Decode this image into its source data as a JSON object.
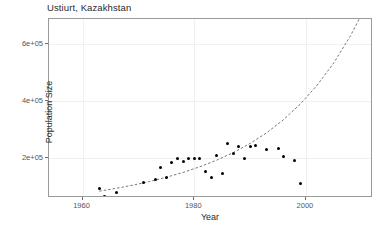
{
  "chart_data": {
    "type": "scatter",
    "title": "Ustiurt, Kazakhstan",
    "xlabel": "Year",
    "ylabel": "Population Size",
    "grid": true,
    "legend": false,
    "xlim": [
      1954,
      2012
    ],
    "ylim": [
      58000,
      688000
    ],
    "xticks": [
      1960,
      1980,
      2000
    ],
    "xtick_labels": [
      "1960",
      "1980",
      "2000"
    ],
    "yticks": [
      200000,
      400000,
      600000
    ],
    "ytick_labels": [
      "2e+05",
      "4e+05",
      "6e+05"
    ],
    "series": [
      {
        "name": "Observed population",
        "marker": "filled-circle",
        "color": "#000000",
        "points": [
          {
            "x": 1963,
            "y": 90000
          },
          {
            "x": 1964,
            "y": 63000
          },
          {
            "x": 1966,
            "y": 79000
          },
          {
            "x": 1971,
            "y": 112000
          },
          {
            "x": 1973,
            "y": 124000
          },
          {
            "x": 1974,
            "y": 164000
          },
          {
            "x": 1975,
            "y": 131000
          },
          {
            "x": 1976,
            "y": 182000
          },
          {
            "x": 1977,
            "y": 196000
          },
          {
            "x": 1978,
            "y": 185000
          },
          {
            "x": 1979,
            "y": 197000
          },
          {
            "x": 1980,
            "y": 197000
          },
          {
            "x": 1981,
            "y": 197000
          },
          {
            "x": 1982,
            "y": 150000
          },
          {
            "x": 1983,
            "y": 131000
          },
          {
            "x": 1984,
            "y": 209000
          },
          {
            "x": 1985,
            "y": 143000
          },
          {
            "x": 1986,
            "y": 251000
          },
          {
            "x": 1987,
            "y": 216000
          },
          {
            "x": 1988,
            "y": 240000
          },
          {
            "x": 1989,
            "y": 197000
          },
          {
            "x": 1990,
            "y": 240000
          },
          {
            "x": 1991,
            "y": 243000
          },
          {
            "x": 1993,
            "y": 228000
          },
          {
            "x": 1995,
            "y": 232000
          },
          {
            "x": 1996,
            "y": 205000
          },
          {
            "x": 1998,
            "y": 190000
          },
          {
            "x": 1999,
            "y": 108000
          }
        ]
      }
    ],
    "fit_curve": {
      "name": "Exponential trend",
      "style": "dashed",
      "color": "#777777",
      "points": [
        {
          "x": 1963,
          "y": 82000
        },
        {
          "x": 1966,
          "y": 92000
        },
        {
          "x": 1969,
          "y": 103000
        },
        {
          "x": 1972,
          "y": 116000
        },
        {
          "x": 1975,
          "y": 131000
        },
        {
          "x": 1978,
          "y": 148000
        },
        {
          "x": 1981,
          "y": 168000
        },
        {
          "x": 1984,
          "y": 191000
        },
        {
          "x": 1987,
          "y": 218000
        },
        {
          "x": 1990,
          "y": 250000
        },
        {
          "x": 1993,
          "y": 288000
        },
        {
          "x": 1996,
          "y": 334000
        },
        {
          "x": 1999,
          "y": 389000
        },
        {
          "x": 2002,
          "y": 455000
        },
        {
          "x": 2005,
          "y": 534000
        },
        {
          "x": 2008,
          "y": 630000
        },
        {
          "x": 2010,
          "y": 706000
        }
      ]
    }
  }
}
